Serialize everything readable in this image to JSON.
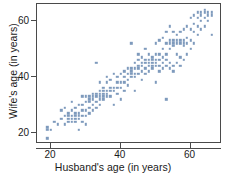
{
  "chart_data": {
    "type": "scatter",
    "title": "",
    "xlabel": "Husband's age (in years)",
    "ylabel": "Wife's age (in years)",
    "xlim": [
      16,
      69
    ],
    "ylim": [
      16,
      66
    ],
    "xticks": [
      20,
      40,
      60
    ],
    "yticks": [
      20,
      40,
      60
    ],
    "xticklabels": [
      "20",
      "40",
      "60"
    ],
    "yticklabels": [
      "20",
      "40",
      "60"
    ],
    "grid": false,
    "legend": null,
    "marker": {
      "shape": "square",
      "color": "#7e9abc",
      "size_px": 2.4
    },
    "series": [
      {
        "name": "couples",
        "color": "#7e9abc",
        "points": [
          [
            19,
            18
          ],
          [
            19,
            21
          ],
          [
            19,
            22
          ],
          [
            20,
            21
          ],
          [
            21,
            24
          ],
          [
            22,
            23
          ],
          [
            23,
            25
          ],
          [
            23,
            28
          ],
          [
            24,
            23
          ],
          [
            24,
            26
          ],
          [
            24,
            29
          ],
          [
            25,
            24
          ],
          [
            25,
            25
          ],
          [
            25,
            26
          ],
          [
            25,
            27
          ],
          [
            26,
            24
          ],
          [
            26,
            25
          ],
          [
            26,
            26
          ],
          [
            26,
            28
          ],
          [
            26,
            31
          ],
          [
            27,
            24
          ],
          [
            27,
            25
          ],
          [
            27,
            26
          ],
          [
            27,
            27
          ],
          [
            27,
            29
          ],
          [
            28,
            21
          ],
          [
            28,
            25
          ],
          [
            28,
            26
          ],
          [
            28,
            27
          ],
          [
            28,
            30
          ],
          [
            29,
            24
          ],
          [
            29,
            26
          ],
          [
            29,
            28
          ],
          [
            29,
            30
          ],
          [
            29,
            33
          ],
          [
            30,
            23
          ],
          [
            30,
            26
          ],
          [
            30,
            28
          ],
          [
            30,
            31
          ],
          [
            30,
            33
          ],
          [
            31,
            27
          ],
          [
            31,
            29
          ],
          [
            31,
            31
          ],
          [
            31,
            32
          ],
          [
            31,
            33
          ],
          [
            32,
            28
          ],
          [
            32,
            30
          ],
          [
            32,
            32
          ],
          [
            32,
            33
          ],
          [
            32,
            34
          ],
          [
            33,
            29
          ],
          [
            33,
            31
          ],
          [
            33,
            33
          ],
          [
            33,
            34
          ],
          [
            33,
            45
          ],
          [
            34,
            30
          ],
          [
            34,
            32
          ],
          [
            34,
            33
          ],
          [
            34,
            34
          ],
          [
            34,
            35
          ],
          [
            34,
            38
          ],
          [
            35,
            32
          ],
          [
            35,
            33
          ],
          [
            35,
            34
          ],
          [
            35,
            35
          ],
          [
            35,
            36
          ],
          [
            36,
            33
          ],
          [
            36,
            34
          ],
          [
            36,
            35
          ],
          [
            36,
            38
          ],
          [
            36,
            40
          ],
          [
            37,
            33
          ],
          [
            37,
            35
          ],
          [
            37,
            36
          ],
          [
            37,
            39
          ],
          [
            38,
            30
          ],
          [
            38,
            35
          ],
          [
            38,
            36
          ],
          [
            38,
            41
          ],
          [
            39,
            34
          ],
          [
            39,
            36
          ],
          [
            39,
            38
          ],
          [
            39,
            40
          ],
          [
            40,
            32
          ],
          [
            40,
            36
          ],
          [
            40,
            38
          ],
          [
            40,
            41
          ],
          [
            41,
            35
          ],
          [
            41,
            38
          ],
          [
            41,
            40
          ],
          [
            41,
            42
          ],
          [
            42,
            37
          ],
          [
            42,
            39
          ],
          [
            42,
            41
          ],
          [
            42,
            43
          ],
          [
            43,
            40
          ],
          [
            43,
            41
          ],
          [
            43,
            42
          ],
          [
            43,
            43
          ],
          [
            43,
            52
          ],
          [
            44,
            35
          ],
          [
            44,
            40
          ],
          [
            44,
            41
          ],
          [
            44,
            43
          ],
          [
            44,
            45
          ],
          [
            45,
            41
          ],
          [
            45,
            43
          ],
          [
            45,
            44
          ],
          [
            45,
            46
          ],
          [
            45,
            48
          ],
          [
            46,
            39
          ],
          [
            46,
            42
          ],
          [
            46,
            44
          ],
          [
            46,
            45
          ],
          [
            46,
            47
          ],
          [
            47,
            41
          ],
          [
            47,
            43
          ],
          [
            47,
            45
          ],
          [
            47,
            46
          ],
          [
            47,
            50
          ],
          [
            48,
            42
          ],
          [
            48,
            44
          ],
          [
            48,
            45
          ],
          [
            48,
            46
          ],
          [
            48,
            48
          ],
          [
            49,
            43
          ],
          [
            49,
            44
          ],
          [
            49,
            45
          ],
          [
            49,
            46
          ],
          [
            49,
            47
          ],
          [
            50,
            38
          ],
          [
            50,
            44
          ],
          [
            50,
            45
          ],
          [
            50,
            46
          ],
          [
            50,
            48
          ],
          [
            50,
            52
          ],
          [
            51,
            42
          ],
          [
            51,
            44
          ],
          [
            51,
            46
          ],
          [
            51,
            48
          ],
          [
            51,
            53
          ],
          [
            52,
            43
          ],
          [
            52,
            45
          ],
          [
            52,
            47
          ],
          [
            52,
            50
          ],
          [
            52,
            54
          ],
          [
            53,
            32
          ],
          [
            53,
            44
          ],
          [
            53,
            46
          ],
          [
            53,
            48
          ],
          [
            53,
            52
          ],
          [
            53,
            56
          ],
          [
            54,
            43
          ],
          [
            54,
            45
          ],
          [
            54,
            50
          ],
          [
            54,
            52
          ],
          [
            54,
            53
          ],
          [
            54,
            58
          ],
          [
            55,
            42
          ],
          [
            55,
            44
          ],
          [
            55,
            51
          ],
          [
            55,
            52
          ],
          [
            55,
            53
          ],
          [
            55,
            56
          ],
          [
            56,
            45
          ],
          [
            56,
            48
          ],
          [
            56,
            52
          ],
          [
            56,
            53
          ],
          [
            56,
            55
          ],
          [
            57,
            44
          ],
          [
            57,
            47
          ],
          [
            57,
            52
          ],
          [
            57,
            53
          ],
          [
            57,
            56
          ],
          [
            58,
            46
          ],
          [
            58,
            51
          ],
          [
            58,
            52
          ],
          [
            58,
            53
          ],
          [
            58,
            57
          ],
          [
            59,
            48
          ],
          [
            59,
            52
          ],
          [
            59,
            54
          ],
          [
            59,
            58
          ],
          [
            60,
            50
          ],
          [
            60,
            53
          ],
          [
            60,
            57
          ],
          [
            60,
            61
          ],
          [
            61,
            52
          ],
          [
            61,
            56
          ],
          [
            61,
            59
          ],
          [
            61,
            62
          ],
          [
            62,
            55
          ],
          [
            62,
            58
          ],
          [
            62,
            61
          ],
          [
            62,
            63
          ],
          [
            63,
            57
          ],
          [
            63,
            60
          ],
          [
            63,
            62
          ],
          [
            63,
            63
          ],
          [
            64,
            58
          ],
          [
            64,
            61
          ],
          [
            64,
            63
          ],
          [
            64,
            64
          ],
          [
            65,
            60
          ],
          [
            65,
            62
          ],
          [
            65,
            63
          ],
          [
            66,
            55
          ],
          [
            66,
            62
          ],
          [
            66,
            63
          ]
        ]
      }
    ]
  }
}
